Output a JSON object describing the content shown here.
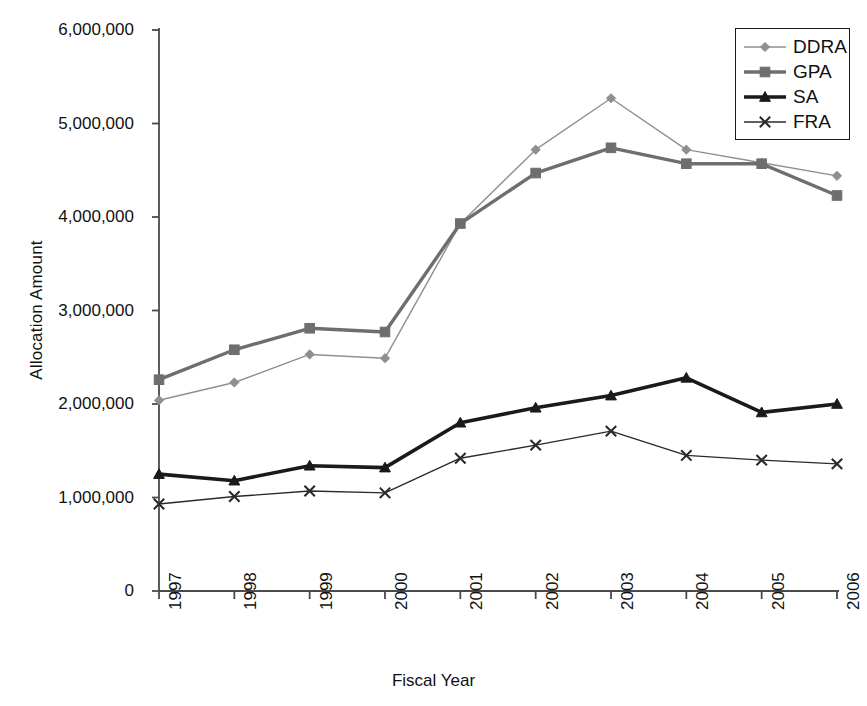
{
  "chart_data": {
    "type": "line",
    "title": "",
    "xlabel": "Fiscal Year",
    "ylabel": "Allocation Amount",
    "categories": [
      "1997",
      "1998",
      "1999",
      "2000",
      "2001",
      "2002",
      "2003",
      "2004",
      "2005",
      "2006"
    ],
    "x": [
      1997,
      1998,
      1999,
      2000,
      2001,
      2002,
      2003,
      2004,
      2005,
      2006
    ],
    "ylim": [
      0,
      6000000
    ],
    "xlim_index": [
      0,
      9
    ],
    "y_ticks": [
      0,
      1000000,
      2000000,
      3000000,
      4000000,
      5000000,
      6000000
    ],
    "y_tick_labels": [
      "0",
      "1,000,000",
      "2,000,000",
      "3,000,000",
      "4,000,000",
      "5,000,000",
      "6,000,000"
    ],
    "grid": false,
    "legend_position": "top-right",
    "series": [
      {
        "name": "DDRA",
        "marker": "diamond",
        "color": "#8f8f8f",
        "line_width": 1.4,
        "values": [
          2040000,
          2230000,
          2530000,
          2490000,
          3930000,
          4720000,
          5270000,
          4720000,
          4580000,
          4440000
        ]
      },
      {
        "name": "GPA",
        "marker": "square",
        "color": "#6e6e6e",
        "line_width": 3.4,
        "values": [
          2260000,
          2580000,
          2810000,
          2770000,
          3930000,
          4470000,
          4740000,
          4570000,
          4570000,
          4230000
        ]
      },
      {
        "name": "SA",
        "marker": "triangle",
        "color": "#1a1a1a",
        "line_width": 3.6,
        "values": [
          1250000,
          1180000,
          1340000,
          1320000,
          1800000,
          1960000,
          2090000,
          2280000,
          1910000,
          2000000
        ]
      },
      {
        "name": "FRA",
        "marker": "x",
        "color": "#2a2a2a",
        "line_width": 1.4,
        "values": [
          930000,
          1010000,
          1070000,
          1050000,
          1420000,
          1560000,
          1710000,
          1450000,
          1400000,
          1360000
        ]
      }
    ]
  },
  "legend": {
    "items": [
      {
        "label": "DDRA"
      },
      {
        "label": "GPA"
      },
      {
        "label": "SA"
      },
      {
        "label": "FRA"
      }
    ]
  },
  "axes": {
    "x_title": "Fiscal Year",
    "y_title": "Allocation Amount",
    "axis_color": "#4a4a4a"
  }
}
